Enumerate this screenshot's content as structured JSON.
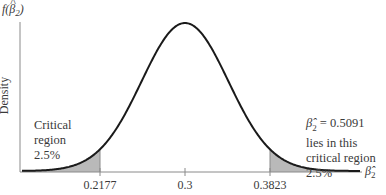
{
  "chart_data": {
    "type": "area",
    "title": "",
    "xlabel": "β̂2",
    "ylabel": "Density",
    "y_axis_label_top": "f(β̂2)",
    "distribution": "normal",
    "mean": 0.3,
    "std": 0.042,
    "x_ticks": [
      "0.2177",
      "0.3",
      "0.3823"
    ],
    "x_tick_values": [
      0.2177,
      0.3,
      0.3823
    ],
    "shaded_regions": [
      {
        "from": null,
        "to": 0.2177,
        "area_pct": 2.5,
        "label": "Critical region 2.5%"
      },
      {
        "from": 0.3823,
        "to": null,
        "area_pct": 2.5,
        "label": "β̂2 = 0.5091 lies in this critical region 2.5%"
      }
    ],
    "grid": false,
    "colors": {
      "curve": "#1a1a1a",
      "shade": "#b9b9b9",
      "axis": "#8a8a8a"
    }
  },
  "labels": {
    "fx": "f(β̂2)",
    "density": "Density",
    "left_annotation": [
      "Critical",
      "region",
      "2.5%"
    ],
    "right_annotation": [
      "β̂2 = 0.5091",
      "lies in this",
      "critical region",
      "2.5%"
    ],
    "x_axis_symbol": "β̂2",
    "ticks": [
      "0.2177",
      "0.3",
      "0.3823"
    ]
  }
}
